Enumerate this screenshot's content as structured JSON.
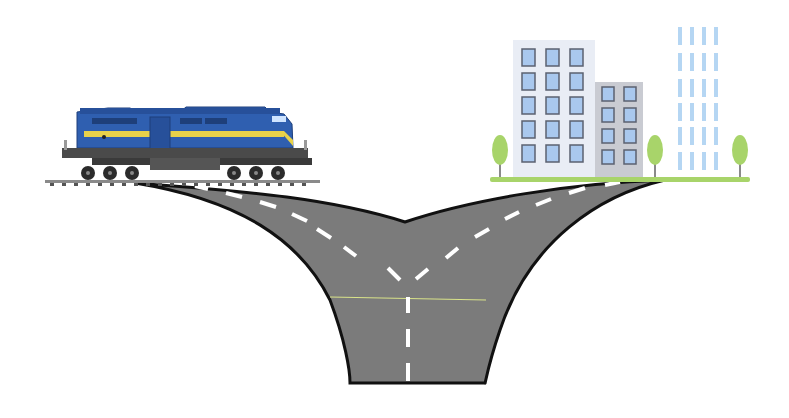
{
  "scene": {
    "description": "Illustration of a road forking in two directions: a locomotive on the left branch, city buildings on the right branch",
    "background": "#ffffff"
  },
  "train": {
    "label": "locomotive",
    "number_plate": "2161",
    "colors": {
      "body": "#2f5fb0",
      "stripe": "#e8d24a",
      "chassis": "#4a4a4a",
      "dark": "#2b2b2b"
    }
  },
  "city": {
    "label": "city buildings",
    "colors": {
      "tall_building": "#e9edf5",
      "mid_building": "#c9cbd2",
      "window": "#a9c8ee",
      "window_frame": "#5b6170",
      "faint_windows": "#b5d6f3",
      "tree": "#a8d46a",
      "trunk": "#8a8a8a",
      "ground": "#a8d46a"
    }
  },
  "road": {
    "label": "forked road",
    "colors": {
      "asphalt": "#7b7b7b",
      "edge": "#111111",
      "marking": "#ffffff",
      "stopline": "#d9e38a"
    }
  }
}
